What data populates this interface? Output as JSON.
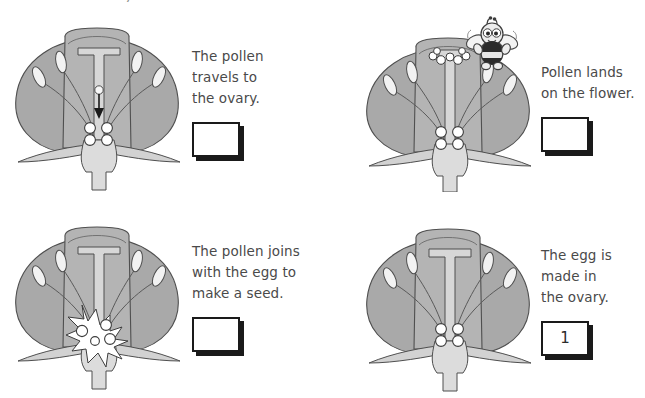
{
  "page": {
    "top_heading": "The bees did for you.",
    "background_color": "#ffffff",
    "text_color": "#4a4a4a",
    "box_border_color": "#1a1a1a",
    "petal_fill": "#a9a9a9",
    "petal_inner_fill": "#b4b4b4",
    "style_fill": "#cfcfcf",
    "ovary_fill": "#dcdcdc",
    "sepal_fill": "#d2d2d2",
    "outline_color": "#4f4f4f"
  },
  "panels": [
    {
      "id": "panel-pollen-travels",
      "caption": "The pollen\ntravels to\nthe ovary.",
      "answer_value": "",
      "has_bee": false,
      "diagram": "flower-with-pollen-tube-arrow",
      "diagram_name": "flower-cross-section-pollen-travelling"
    },
    {
      "id": "panel-pollen-lands",
      "caption": "Pollen lands\non the flower.",
      "answer_value": "",
      "has_bee": true,
      "diagram": "flower-with-bee-on-stigma",
      "diagram_name": "flower-cross-section-bee-landing"
    },
    {
      "id": "panel-pollen-joins-egg",
      "caption": "The pollen joins\nwith the egg to\nmake a seed.",
      "answer_value": "",
      "has_bee": false,
      "diagram": "flower-with-fertilisation-burst",
      "diagram_name": "flower-cross-section-fertilisation"
    },
    {
      "id": "panel-egg-made",
      "caption": "The egg is\nmade in\nthe ovary.",
      "answer_value": "1",
      "has_bee": false,
      "diagram": "flower-plain",
      "diagram_name": "flower-cross-section-egg-in-ovary"
    }
  ]
}
